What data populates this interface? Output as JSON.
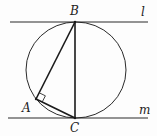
{
  "diagram": {
    "type": "geometry",
    "colors": {
      "stroke": "#2a2a2a",
      "background": "#fdfdfd"
    },
    "lines": [
      {
        "name": "l",
        "label": "l",
        "x1": 10,
        "y1": 22,
        "x2": 148,
        "y2": 22
      },
      {
        "name": "m",
        "label": "m",
        "x1": 8,
        "y1": 118,
        "x2": 148,
        "y2": 118
      }
    ],
    "circle": {
      "cx": 76,
      "cy": 70,
      "rx": 50,
      "ry": 48
    },
    "points": {
      "A": {
        "label": "A",
        "x": 36,
        "y": 99
      },
      "B": {
        "label": "B",
        "x": 75,
        "y": 22
      },
      "C": {
        "label": "C",
        "x": 75,
        "y": 118
      }
    },
    "segments": [
      "AB",
      "BC",
      "AC"
    ],
    "right_angle_marker": {
      "at": "A"
    },
    "labels": {
      "A": "A",
      "B": "B",
      "C": "C",
      "l": "l",
      "m": "m"
    }
  }
}
